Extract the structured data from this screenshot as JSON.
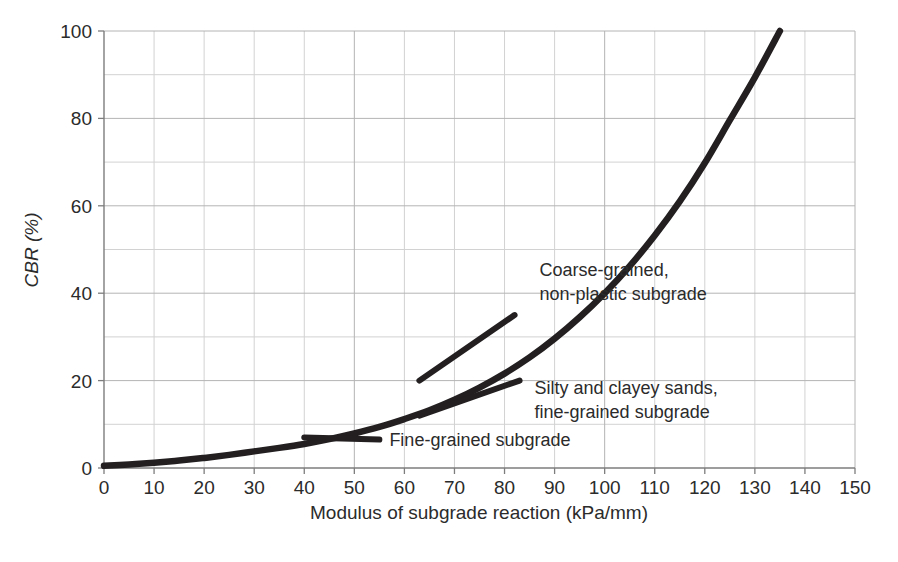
{
  "chart_data": {
    "type": "line",
    "title": "",
    "xlabel": "Modulus of subgrade reaction (kPa/mm)",
    "ylabel": "CBR (%)",
    "xlim": [
      0,
      150
    ],
    "ylim": [
      0,
      100
    ],
    "xticks": [
      0,
      10,
      20,
      30,
      40,
      50,
      60,
      70,
      80,
      90,
      100,
      110,
      120,
      130,
      140,
      150
    ],
    "yticks": [
      0,
      20,
      40,
      60,
      80,
      100
    ],
    "x_minor_step": 10,
    "y_minor_step": 10,
    "grid": true,
    "legend": "none",
    "series": [
      {
        "name": "CBR vs modulus of subgrade reaction",
        "x": [
          0,
          5,
          10,
          15,
          20,
          25,
          30,
          35,
          40,
          45,
          50,
          55,
          60,
          65,
          70,
          75,
          80,
          85,
          90,
          95,
          100,
          105,
          110,
          115,
          120,
          125,
          130,
          135
        ],
        "values": [
          0.5,
          0.8,
          1.2,
          1.7,
          2.3,
          3.0,
          3.8,
          4.6,
          5.5,
          6.6,
          7.9,
          9.4,
          11.2,
          13.2,
          15.6,
          18.4,
          21.6,
          25.3,
          29.6,
          34.5,
          40.0,
          46.2,
          53.2,
          61.0,
          69.8,
          79.6,
          89.4,
          100.0
        ]
      }
    ],
    "annotations": [
      {
        "id": "coarse-grained",
        "lines": [
          "Coarse-grained,",
          "non-plastic subgrade"
        ],
        "text": "Coarse-grained, non-plastic subgrade",
        "leader_from": [
          63,
          20
        ],
        "leader_to": [
          82,
          35
        ],
        "label_at": [
          87,
          44
        ]
      },
      {
        "id": "silty-clayey",
        "lines": [
          "Silty and clayey sands,",
          "fine-grained subgrade"
        ],
        "text": "Silty and clayey sands, fine-grained subgrade",
        "leader_from": [
          63,
          12
        ],
        "leader_to": [
          83,
          20
        ],
        "label_at": [
          86,
          17
        ]
      },
      {
        "id": "fine-grained",
        "lines": [
          "Fine-grained subgrade"
        ],
        "text": "Fine-grained subgrade",
        "leader_from": [
          40,
          7
        ],
        "leader_to": [
          55,
          6.5
        ],
        "label_at": [
          57,
          5
        ]
      }
    ],
    "colors": {
      "curve": "#231f20",
      "grid_minor": "#d2d2d2",
      "grid_major": "#b4b4b4",
      "axis": "#7d7d7d",
      "text": "#2b2b2b",
      "background": "#ffffff"
    }
  }
}
